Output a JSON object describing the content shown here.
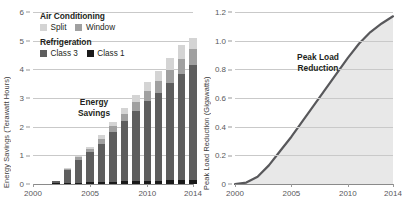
{
  "chart_data": [
    {
      "type": "bar",
      "id": "energy-savings",
      "title": "",
      "xlabel": "",
      "ylabel": "Energy Savings (Terawatt Hours)",
      "stacked": true,
      "grid": true,
      "legend_position": "top-left",
      "xlim": [
        2000,
        2014
      ],
      "ylim": [
        0,
        6
      ],
      "yticks": [
        0,
        1,
        2,
        3,
        4,
        5,
        6
      ],
      "ytick_labels": [
        "0",
        "1",
        "2",
        "3",
        "4",
        "5",
        "6"
      ],
      "xticks": [
        2000,
        2005,
        2010,
        2014
      ],
      "xtick_labels": [
        "2000",
        "2005",
        "2010",
        "2014"
      ],
      "categories": [
        2002,
        2003,
        2004,
        2005,
        2006,
        2007,
        2008,
        2009,
        2010,
        2011,
        2012,
        2013,
        2014
      ],
      "series": [
        {
          "name": "Class 1",
          "group": "Refrigeration",
          "color": "#1a1a1a",
          "values": [
            0.02,
            0.04,
            0.05,
            0.06,
            0.07,
            0.08,
            0.09,
            0.1,
            0.11,
            0.12,
            0.13,
            0.14,
            0.15
          ]
        },
        {
          "name": "Class 3",
          "group": "Refrigeration",
          "color": "#5e5e5e",
          "values": [
            0.1,
            0.46,
            0.8,
            1.04,
            1.33,
            1.72,
            2.1,
            2.43,
            2.78,
            3.04,
            3.39,
            3.71,
            4.01
          ]
        },
        {
          "name": "Window",
          "group": "Air Conditioning",
          "color": "#a0a0a0",
          "values": [
            0.0,
            0.04,
            0.08,
            0.12,
            0.18,
            0.22,
            0.26,
            0.32,
            0.36,
            0.42,
            0.45,
            0.5,
            0.55
          ]
        },
        {
          "name": "Split",
          "group": "Air Conditioning",
          "color": "#d4d4d4",
          "values": [
            0.0,
            0.02,
            0.05,
            0.08,
            0.12,
            0.16,
            0.2,
            0.25,
            0.3,
            0.37,
            0.43,
            0.5,
            0.39
          ]
        }
      ],
      "annotation": "Energy\nSavings",
      "legend": {
        "groups": [
          {
            "heading": "Air Conditioning",
            "items": [
              {
                "label": "Split",
                "color": "#d4d4d4"
              },
              {
                "label": "Window",
                "color": "#a0a0a0"
              }
            ]
          },
          {
            "heading": "Refrigeration",
            "items": [
              {
                "label": "Class 3",
                "color": "#5e5e5e"
              },
              {
                "label": "Class 1",
                "color": "#1a1a1a"
              }
            ]
          }
        ]
      }
    },
    {
      "type": "area",
      "id": "peak-load-reduction",
      "title": "",
      "xlabel": "",
      "ylabel": "Peak Load Reduction (Gigawatts)",
      "grid": true,
      "line_color": "#58585b",
      "fill_color": "#e8e8e8",
      "xlim": [
        2000,
        2014
      ],
      "ylim": [
        0,
        1.2
      ],
      "yticks": [
        0,
        0.2,
        0.4,
        0.6,
        0.8,
        1.0,
        1.2
      ],
      "ytick_labels": [
        "0",
        "0.2",
        "0.4",
        "0.6",
        "0.8",
        "1.0",
        "1.2"
      ],
      "xticks": [
        2000,
        2005,
        2010,
        2014
      ],
      "xtick_labels": [
        "2000",
        "2005",
        "2010",
        "2014"
      ],
      "x": [
        2000,
        2001,
        2002,
        2003,
        2004,
        2005,
        2006,
        2007,
        2008,
        2009,
        2010,
        2011,
        2012,
        2013,
        2014
      ],
      "values": [
        0.0,
        0.01,
        0.05,
        0.13,
        0.23,
        0.33,
        0.44,
        0.55,
        0.66,
        0.77,
        0.88,
        0.98,
        1.06,
        1.12,
        1.17
      ],
      "annotation": "Peak Load\nReduction"
    }
  ],
  "left": {
    "ylabel": "Energy Savings (Terawatt Hours)",
    "annotation_line1": "Energy",
    "annotation_line2": "Savings",
    "legend": {
      "ac_heading": "Air Conditioning",
      "split_label": "Split",
      "window_label": "Window",
      "ref_heading": "Refrigeration",
      "class3_label": "Class 3",
      "class1_label": "Class 1"
    },
    "yticks": [
      "6",
      "5",
      "4",
      "3",
      "2",
      "1",
      "0"
    ],
    "xticks": [
      "2000",
      "2005",
      "2010",
      "2014"
    ]
  },
  "right": {
    "ylabel": "Peak Load Reduction (Gigawatts)",
    "annotation_line1": "Peak Load",
    "annotation_line2": "Reduction",
    "yticks": [
      "1.2",
      "1.0",
      "0.8",
      "0.6",
      "0.4",
      "0.2",
      "0"
    ],
    "xticks": [
      "2000",
      "2005",
      "2010",
      "2014"
    ]
  }
}
